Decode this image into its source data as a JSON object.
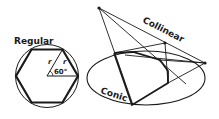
{
  "labels": {
    "regular": "Regular",
    "collinear": "Collinear",
    "conic": "Conic",
    "radius_1": "r",
    "radius_2": "r",
    "angle": "60°"
  },
  "colors": {
    "stroke": "#1a1a1a",
    "background": "#ffffff"
  }
}
